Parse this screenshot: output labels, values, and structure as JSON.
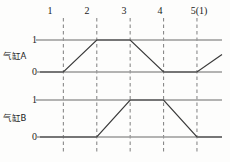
{
  "figure": {
    "title": "",
    "background_color": "#fdfdfc"
  },
  "chart_data": {
    "type": "line",
    "title": "",
    "xlabel": "",
    "ylabel": "",
    "grid": true,
    "legend_position": "left",
    "x_tick_labels": [
      "1",
      "2",
      "3",
      "4",
      "5(1)"
    ],
    "x_tick_values": [
      1,
      2,
      3,
      4,
      5
    ],
    "xlim": [
      0.3,
      5.75
    ],
    "y_tick_labels": [
      "0",
      "1"
    ],
    "ylim": [
      0,
      1
    ],
    "gridline_color": "#8a8a8a",
    "baseline_color": "#9a9a9a",
    "trace_color": "#3a3a3a",
    "series": [
      {
        "name": "气缸A",
        "level_high_label": "1",
        "level_low_label": "0",
        "x": [
          0.3,
          1,
          2,
          3,
          4,
          5,
          5.75
        ],
        "values": [
          0,
          0,
          1,
          1,
          0,
          0,
          0.55
        ]
      },
      {
        "name": "气缸B",
        "level_high_label": "1",
        "level_low_label": "0",
        "x": [
          0.3,
          2,
          3,
          4,
          5,
          5.75
        ],
        "values": [
          0,
          0,
          1,
          1,
          0,
          0
        ]
      }
    ]
  }
}
